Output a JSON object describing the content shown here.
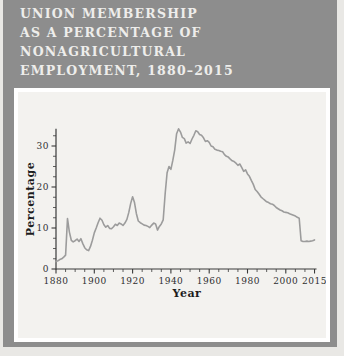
{
  "figure": {
    "title_lines": [
      "UNION MEMBERSHIP",
      "AS A PERCENTAGE OF",
      "NONAGRICULTURAL",
      "EMPLOYMENT, 1880–2015"
    ]
  },
  "colors": {
    "card_background": "#8d8d8d",
    "page_background": "#e9e8e5",
    "panel_background": "#f3f2ef",
    "panel_border": "#ffffff",
    "title_text": "#eeedeb",
    "data_line": "#9c9c9c",
    "axis": "#3a3a3a",
    "tick_text": "#2f2f2f"
  },
  "chart_data": {
    "type": "line",
    "title": "UNION MEMBERSHIP AS A PERCENTAGE OF NONAGRICULTURAL EMPLOYMENT, 1880–2015",
    "xlabel": "Year",
    "ylabel": "Percentage",
    "xlim": [
      1880,
      2017
    ],
    "ylim": [
      0,
      35
    ],
    "grid": false,
    "legend": "none",
    "x_ticks_major": [
      1880,
      1900,
      1920,
      1940,
      1960,
      1980,
      2000,
      2015
    ],
    "x_minor_step": 5,
    "y_ticks_major": [
      0,
      10,
      20,
      30
    ],
    "y_minor_step": 2.5,
    "series": [
      {
        "name": "Union membership (% of nonagricultural employment)",
        "x_start": 1880,
        "x_step": 1,
        "x_end": 2015,
        "values": [
          1.8,
          2.0,
          2.3,
          2.5,
          2.9,
          3.4,
          12.3,
          9.0,
          7.0,
          6.6,
          6.9,
          7.3,
          6.7,
          7.4,
          6.2,
          5.2,
          4.7,
          4.5,
          5.5,
          7.0,
          8.8,
          10.0,
          11.3,
          12.4,
          11.9,
          10.8,
          10.2,
          10.6,
          9.9,
          9.8,
          10.3,
          10.9,
          10.6,
          11.2,
          11.0,
          10.6,
          11.2,
          12.1,
          13.8,
          16.0,
          17.6,
          16.2,
          13.5,
          11.7,
          11.3,
          11.0,
          10.7,
          10.6,
          10.4,
          10.1,
          10.7,
          11.2,
          11.0,
          9.5,
          10.4,
          11.0,
          12.0,
          18.5,
          23.5,
          25.0,
          24.3,
          26.5,
          29.0,
          33.0,
          34.2,
          33.4,
          32.1,
          31.8,
          30.7,
          31.0,
          30.6,
          31.7,
          32.6,
          33.7,
          33.5,
          32.8,
          32.6,
          32.0,
          31.1,
          31.3,
          30.9,
          30.0,
          29.8,
          29.2,
          29.0,
          28.9,
          28.7,
          28.6,
          27.9,
          27.5,
          27.3,
          26.8,
          26.4,
          26.2,
          25.8,
          25.3,
          25.6,
          24.7,
          23.8,
          24.2,
          23.2,
          22.6,
          21.6,
          20.7,
          19.4,
          18.9,
          18.3,
          17.6,
          17.2,
          16.8,
          16.4,
          16.2,
          15.9,
          15.8,
          15.5,
          15.0,
          14.7,
          14.4,
          14.2,
          13.9,
          13.8,
          13.7,
          13.5,
          13.3,
          13.1,
          12.9,
          12.6,
          12.4,
          6.9,
          6.7,
          6.7,
          6.8,
          6.7,
          6.8,
          6.9,
          7.1
        ]
      }
    ]
  }
}
